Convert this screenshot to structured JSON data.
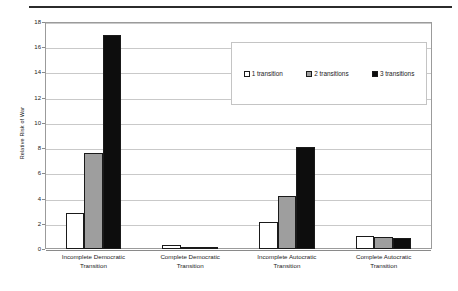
{
  "chart_data": {
    "type": "bar",
    "title": "",
    "subtitle": "",
    "xlabel": "",
    "ylabel": "Relative Risk of War",
    "ylim": [
      0,
      18
    ],
    "ytick_step": 2,
    "yticks": [
      0,
      2,
      4,
      6,
      8,
      10,
      12,
      14,
      16,
      18
    ],
    "grid": true,
    "legend_position": "upper-right-inside",
    "categories": [
      "Incomplete Democratic Transition",
      "Complete Democratic Transition",
      "Incomplete Autocratic Transition",
      "Complete Autocratic Transition"
    ],
    "category_lines": [
      [
        "Incomplete Democratic",
        "Transition"
      ],
      [
        "Complete Democratic",
        "Transition"
      ],
      [
        "Incomplete Autocratic",
        "Transition"
      ],
      [
        "Complete Autocratic",
        "Transition"
      ]
    ],
    "series": [
      {
        "name": "1 transition",
        "color": "#ffffff",
        "values": [
          2.85,
          0.3,
          2.15,
          1.0
        ]
      },
      {
        "name": "2 transitions",
        "color": "#9e9e9e",
        "values": [
          7.6,
          0.1,
          4.2,
          0.95
        ]
      },
      {
        "name": "3 transitions",
        "color": "#0d0d0d",
        "values": [
          17.0,
          0.05,
          8.1,
          0.85
        ]
      }
    ]
  },
  "legend": {
    "items": [
      {
        "label": "1 transition",
        "swatch": "white-square-icon"
      },
      {
        "label": "2 transitions",
        "swatch": "gray-square-icon"
      },
      {
        "label": "3 transitions",
        "swatch": "black-square-icon"
      }
    ]
  },
  "colors": {
    "series_1": "#ffffff",
    "series_2": "#9e9e9e",
    "series_3": "#0d0d0d",
    "grid": "#c9c9c9",
    "frame": "#9b9b9b",
    "rule": "#2b2b2b",
    "text": "#1a1a1a"
  }
}
